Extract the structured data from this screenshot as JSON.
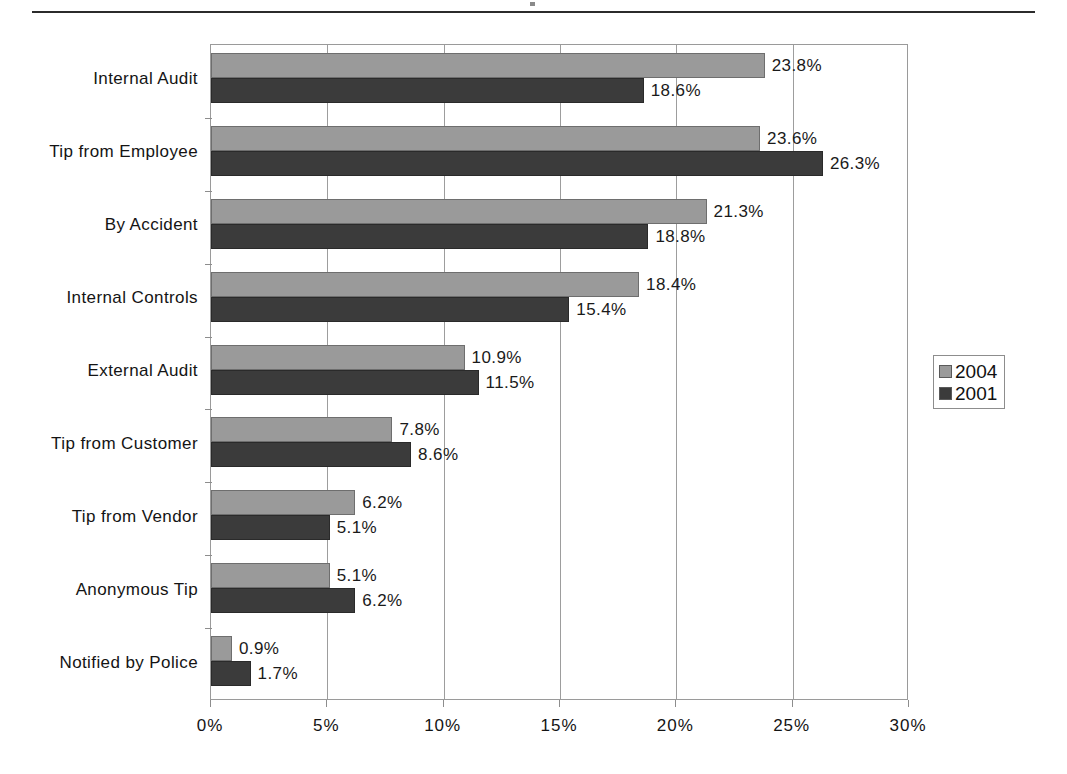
{
  "chart_data": {
    "type": "bar",
    "orientation": "horizontal",
    "title": "",
    "subtitle": "",
    "xlabel": "",
    "ylabel": "",
    "xlim": [
      0,
      30
    ],
    "xtick_labels": [
      "0%",
      "5%",
      "10%",
      "15%",
      "20%",
      "25%",
      "30%"
    ],
    "xtick_values": [
      0,
      5,
      10,
      15,
      20,
      25,
      30
    ],
    "grid": true,
    "grid_axis": "x",
    "legend_position": "right",
    "value_suffix": "%",
    "categories": [
      "Internal Audit",
      "Tip from Employee",
      "By Accident",
      "Internal Controls",
      "External Audit",
      "Tip from Customer",
      "Tip from Vendor",
      "Anonymous Tip",
      "Notified by Police"
    ],
    "series": [
      {
        "name": "2004",
        "color": "#9a9a9a",
        "values": [
          23.8,
          23.6,
          21.3,
          18.4,
          10.9,
          7.8,
          6.2,
          5.1,
          0.9
        ],
        "labels": [
          "23.8%",
          "23.6%",
          "21.3%",
          "18.4%",
          "10.9%",
          "7.8%",
          "6.2%",
          "5.1%",
          "0.9%"
        ]
      },
      {
        "name": "2001",
        "color": "#3b3b3b",
        "values": [
          18.6,
          26.3,
          18.8,
          15.4,
          11.5,
          8.6,
          5.1,
          6.2,
          1.7
        ],
        "labels": [
          "18.6%",
          "26.3%",
          "18.8%",
          "15.4%",
          "11.5%",
          "8.6%",
          "5.1%",
          "6.2%",
          "1.7%"
        ]
      }
    ]
  },
  "legend": {
    "entries": [
      {
        "label": "2004",
        "swatch": "#9a9a9a"
      },
      {
        "label": "2001",
        "swatch": "#3b3b3b"
      }
    ]
  },
  "colors": {
    "series_2004": "#9a9a9a",
    "series_2001": "#3b3b3b",
    "axis": "#8d8d8d",
    "grid": "#9d9d9d",
    "text": "#141414",
    "rule": "#2b2b2b",
    "background": "#ffffff"
  }
}
